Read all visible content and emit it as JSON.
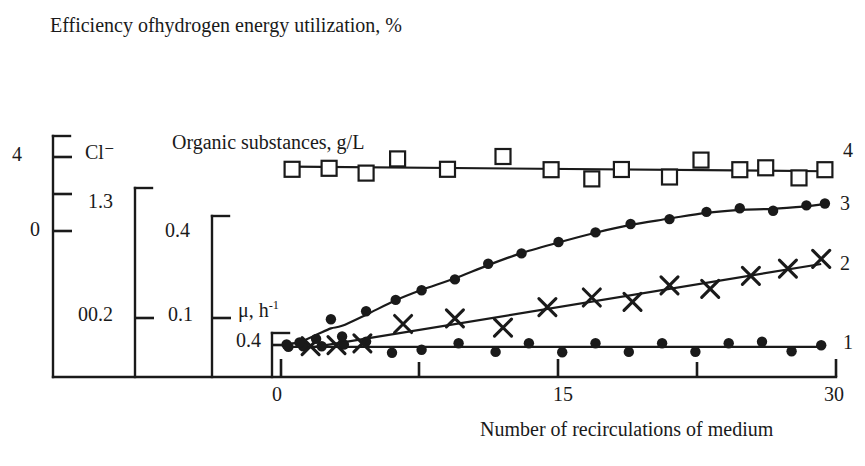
{
  "title": "Efficiency ofhydrogen energy utilization, %",
  "axes": {
    "primary": {
      "unit": "%",
      "ticks": [
        "20",
        "0"
      ]
    },
    "second": {
      "unit": "Cl⁻",
      "ticks": [
        "1.3",
        "00.2"
      ]
    },
    "third": {
      "unit": "Organic substances, g/L",
      "ticks": [
        "0.4",
        "0.1"
      ]
    },
    "fourth": {
      "unit": "μ, h",
      "unit_sup": "-1",
      "ticks": [
        "0.4"
      ]
    },
    "x": {
      "label": "Number of recirculations of medium",
      "ticks": [
        "0",
        "15",
        "30"
      ],
      "min": 0,
      "max": 30
    }
  },
  "series_labels": {
    "s1": "1",
    "s2": "2",
    "s3": "3",
    "s4": "4"
  },
  "colors": {
    "ink": "#1a1a1a",
    "background": "#ffffff"
  },
  "chart_data": {
    "type": "scatter",
    "title": "Efficiency ofhydrogen energy utilization, %",
    "xlabel": "Number of recirculations of medium",
    "ylabel": "Efficiency ofhydrogen energy utilization, % / Cl- / Organic substances, g/L / mu, h-1",
    "xlim": [
      0,
      30
    ],
    "xticks": [
      0,
      7.5,
      15,
      22.5,
      30
    ],
    "xticklabels": [
      "0",
      "",
      "15",
      "",
      "30"
    ],
    "grid": false,
    "legend": "right-inline series numbers 1-4",
    "series": [
      {
        "name": "1",
        "marker": "filled-circle",
        "trend": "flat",
        "scale": "mu, h-1 (fourth axis)",
        "x": [
          0.4,
          1.2,
          2.2,
          3.4,
          4.6,
          6.0,
          7.6,
          9.6,
          11.6,
          13.4,
          15.2,
          17.0,
          18.8,
          20.6,
          22.4,
          24.2,
          26.0,
          27.6,
          29.2
        ],
        "y_axis_fraction": [
          0.125,
          0.127,
          0.128,
          0.135,
          0.147,
          0.101,
          0.113,
          0.14,
          0.104,
          0.14,
          0.103,
          0.14,
          0.104,
          0.14,
          0.105,
          0.14,
          0.146,
          0.107,
          0.132
        ]
      },
      {
        "name": "2",
        "marker": "cross",
        "trend": "linear-rise",
        "scale": "Organic substances, g/L (third axis)",
        "x": [
          1.6,
          3.0,
          4.4,
          6.6,
          9.4,
          12.0,
          14.4,
          16.8,
          19.0,
          21.0,
          23.2,
          25.4,
          27.4,
          29.2
        ],
        "y_axis_fraction": [
          0.128,
          0.132,
          0.14,
          0.22,
          0.243,
          0.205,
          0.29,
          0.33,
          0.312,
          0.38,
          0.366,
          0.42,
          0.45,
          0.49
        ]
      },
      {
        "name": "3",
        "marker": "filled-circle",
        "trend": "saturating-rise",
        "scale": "Cl- (second axis)",
        "x": [
          0.3,
          1.0,
          1.9,
          2.7,
          3.3,
          4.6,
          6.2,
          7.6,
          9.4,
          11.2,
          13.0,
          15.0,
          17.0,
          18.9,
          21.0,
          23.0,
          24.8,
          26.6,
          28.4,
          29.4
        ],
        "y_axis_fraction": [
          0.135,
          0.143,
          0.158,
          0.24,
          0.168,
          0.273,
          0.32,
          0.36,
          0.405,
          0.47,
          0.513,
          0.56,
          0.6,
          0.635,
          0.655,
          0.685,
          0.7,
          0.69,
          0.712,
          0.72
        ]
      },
      {
        "name": "4",
        "marker": "open-square",
        "trend": "flat",
        "scale": "Efficiency, % (primary axis)",
        "x": [
          0.6,
          2.6,
          4.6,
          6.3,
          9.0,
          12.0,
          14.6,
          16.8,
          18.4,
          21.0,
          22.7,
          24.8,
          26.2,
          28.0,
          29.4
        ],
        "y_axis_fraction": [
          0.862,
          0.866,
          0.846,
          0.905,
          0.862,
          0.915,
          0.86,
          0.822,
          0.861,
          0.83,
          0.9,
          0.86,
          0.868,
          0.826,
          0.86
        ]
      }
    ]
  }
}
